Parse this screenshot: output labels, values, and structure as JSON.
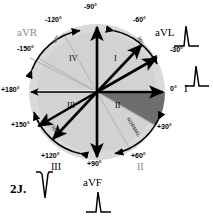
{
  "figure": {
    "number": "2J.",
    "center": {
      "x": 97,
      "y": 92
    },
    "radius": 68
  },
  "colors": {
    "background": "#ffffff",
    "disc_light": "#d9d9d9",
    "disc_inner": "#cfcfcf",
    "wedge_dark": "#6e6e6e",
    "axis_black": "#000000",
    "axis_gray": "#b0b0b0",
    "label_gray": "#8a8a8a",
    "arc_stroke": "#000000"
  },
  "degree_labels": [
    {
      "name": "minus-90",
      "text": "-90°",
      "x": 84,
      "y": 3,
      "gray": false
    },
    {
      "name": "minus-60",
      "text": "-60°",
      "x": 133,
      "y": 16,
      "gray": false
    },
    {
      "name": "minus-30",
      "text": "-30°",
      "x": 170,
      "y": 46,
      "gray": false
    },
    {
      "name": "zero",
      "text": "0°",
      "x": 170,
      "y": 88,
      "gray": false
    },
    {
      "name": "plus-30",
      "text": "+30°",
      "x": 157,
      "y": 123,
      "gray": false
    },
    {
      "name": "plus-60",
      "text": "+60°",
      "x": 131,
      "y": 152,
      "gray": false
    },
    {
      "name": "plus-90",
      "text": "+90°",
      "x": 87,
      "y": 160,
      "gray": false
    },
    {
      "name": "plus-120",
      "text": "+120°",
      "x": 41,
      "y": 152,
      "gray": false
    },
    {
      "name": "plus-150",
      "text": "+150°",
      "x": 11,
      "y": 121,
      "gray": false
    },
    {
      "name": "plus-180",
      "text": "+180°",
      "x": 1,
      "y": 87,
      "gray": false
    },
    {
      "name": "minus-150",
      "text": "-150°",
      "x": 17,
      "y": 45,
      "gray": false
    },
    {
      "name": "minus-120",
      "text": "-120°",
      "x": 45,
      "y": 16,
      "gray": false
    }
  ],
  "lead_labels": [
    {
      "name": "lead-avr",
      "text": "aVR",
      "x": 17,
      "y": 30,
      "gray": true
    },
    {
      "name": "lead-avl",
      "text": "aVL",
      "x": 155,
      "y": 29,
      "gray": false
    },
    {
      "name": "lead-i",
      "text": "I",
      "x": 184,
      "y": 86,
      "gray": false
    },
    {
      "name": "lead-ii",
      "text": "II",
      "x": 136,
      "y": 163,
      "gray": true
    },
    {
      "name": "lead-iii",
      "text": "III",
      "x": 51,
      "y": 163,
      "gray": false
    },
    {
      "name": "lead-avf",
      "text": "aVF",
      "x": 83,
      "y": 178,
      "gray": false
    }
  ],
  "quadrant_labels": [
    {
      "name": "quadrant-I",
      "text": "I",
      "x": 114,
      "y": 58
    },
    {
      "name": "quadrant-II",
      "text": "II",
      "x": 115,
      "y": 104
    },
    {
      "name": "quadrant-III",
      "text": "III",
      "x": 69,
      "y": 104
    },
    {
      "name": "quadrant-IV",
      "text": "IV",
      "x": 70,
      "y": 58
    }
  ],
  "arc_labels": [
    {
      "name": "arc-label-upper-left",
      "text": "30°",
      "x": 54,
      "y": 38,
      "rotate": -60
    },
    {
      "name": "arc-label-upper-right",
      "text": "30°",
      "x": 139,
      "y": 39,
      "rotate": 60
    },
    {
      "name": "arc-label-lower-left",
      "text": "30°",
      "x": 53,
      "y": 128,
      "rotate": 60
    },
    {
      "name": "arc-label-lower-right",
      "text": "NORMAL",
      "x": 128,
      "y": 126,
      "rotate": 60
    }
  ],
  "ecg_tracings": [
    {
      "name": "ecg-avl",
      "label": "aVL",
      "polarity": "positive",
      "x": 186,
      "y": 38
    },
    {
      "name": "ecg-i",
      "label": "I",
      "polarity": "positive",
      "x": 196,
      "y": 78
    },
    {
      "name": "ecg-iii",
      "label": "III",
      "polarity": "negative",
      "x": 44,
      "y": 190
    },
    {
      "name": "ecg-avf",
      "label": "aVF",
      "polarity": "positive",
      "x": 98,
      "y": 204
    }
  ],
  "axis_vectors": [
    {
      "name": "axis-minus-90",
      "degrees": -90,
      "style": "black-thick"
    },
    {
      "name": "axis-minus-60",
      "degrees": -60,
      "style": "black-thick"
    },
    {
      "name": "axis-minus-30",
      "degrees": -30,
      "style": "black-thick"
    },
    {
      "name": "axis-0",
      "degrees": 0,
      "style": "black-thick"
    },
    {
      "name": "axis-plus-30",
      "degrees": 30,
      "style": "gray-thin"
    },
    {
      "name": "axis-plus-60",
      "degrees": 60,
      "style": "gray-thin"
    },
    {
      "name": "axis-plus-90",
      "degrees": 90,
      "style": "black-thick"
    },
    {
      "name": "axis-plus-120",
      "degrees": 120,
      "style": "black-thick"
    },
    {
      "name": "axis-plus-150",
      "degrees": 150,
      "style": "black-thick"
    },
    {
      "name": "axis-180",
      "degrees": 180,
      "style": "gray-thin"
    },
    {
      "name": "axis-minus-150",
      "degrees": -150,
      "style": "gray-thin"
    },
    {
      "name": "axis-minus-120",
      "degrees": -120,
      "style": "gray-thin"
    }
  ]
}
